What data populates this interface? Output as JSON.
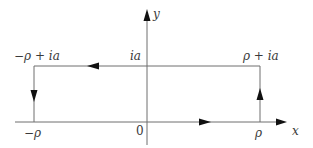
{
  "diagram": {
    "type": "complex-plane rectangular contour",
    "axes": {
      "x_label": "x",
      "y_label": "y",
      "origin_label": "0"
    },
    "vertices": {
      "bottom_left": "−ρ",
      "bottom_right": "ρ",
      "top_right": "ρ + ia",
      "top_left": "−ρ + ia",
      "top_axis_intercept": "ia"
    },
    "contour_direction": "counterclockwise",
    "edge_arrows": [
      {
        "edge": "bottom",
        "direction": "right"
      },
      {
        "edge": "right",
        "direction": "up"
      },
      {
        "edge": "top",
        "direction": "left"
      },
      {
        "edge": "left",
        "direction": "down"
      }
    ],
    "colors": {
      "line": "#6e6e6e",
      "arrow": "#111111",
      "text": "#3a3a3a",
      "background": "#ffffff"
    }
  }
}
